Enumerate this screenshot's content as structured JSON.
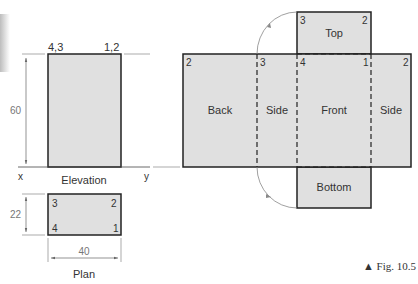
{
  "figure": {
    "caption": "▲ Fig. 10.5",
    "colors": {
      "fill": "#e0e0e0",
      "stroke": "#222222",
      "dim": "#777777",
      "arc": "#888888"
    }
  },
  "elevation": {
    "title": "Elevation",
    "corner_left": "4,3",
    "corner_right": "1,2",
    "height_dim": "60",
    "xy_left": "x",
    "xy_right": "y"
  },
  "plan": {
    "title": "Plan",
    "corners": {
      "tl": "3",
      "tr": "2",
      "bl": "4",
      "br": "1"
    },
    "depth_dim": "22",
    "width_dim": "40"
  },
  "development": {
    "faces": [
      {
        "id": "back",
        "label": "Back"
      },
      {
        "id": "side-left",
        "label": "Side"
      },
      {
        "id": "front",
        "label": "Front"
      },
      {
        "id": "side-right",
        "label": "Side"
      },
      {
        "id": "top",
        "label": "Top"
      },
      {
        "id": "bottom",
        "label": "Bottom"
      }
    ],
    "strip_points": [
      "2",
      "3",
      "4",
      "1",
      "2"
    ],
    "top_points": {
      "left": "3",
      "right": "2"
    }
  }
}
